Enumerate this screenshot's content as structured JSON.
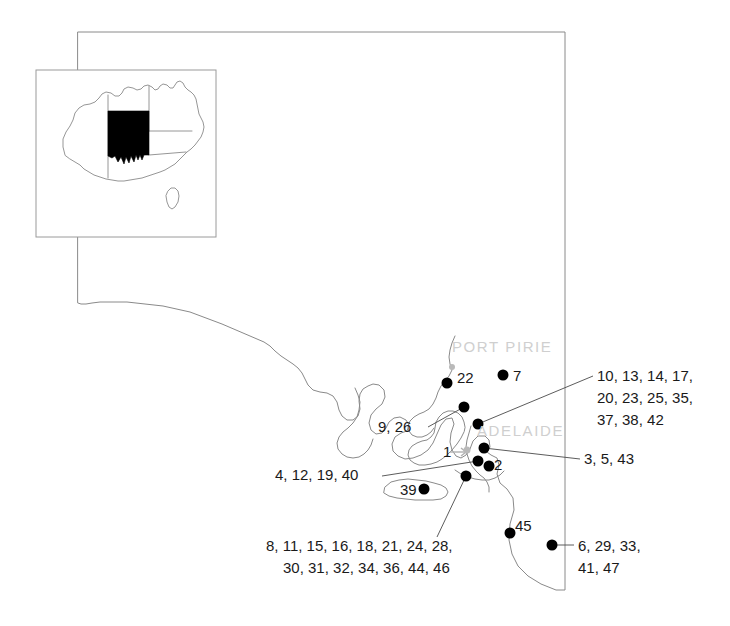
{
  "figure": {
    "name": "south-australia-site-map",
    "region": "South Australia",
    "background_color": "#ffffff",
    "outline_color": "#8a8a8a",
    "dot_color": "#000000",
    "city_label_color": "#cfcfcf",
    "label_color": "#1a1a1a"
  },
  "inset": {
    "name": "australia-locator-inset",
    "highlight_color": "#000000",
    "frame_color": "#9a9a9a"
  },
  "city_labels": [
    {
      "text": "PORT PIRIE",
      "x": 452,
      "y": 352
    },
    {
      "text": "ADELAIDE",
      "x": 477,
      "y": 436
    }
  ],
  "site_dots": [
    {
      "id": "dot-22",
      "x": 447,
      "y": 383
    },
    {
      "id": "dot-7",
      "x": 503,
      "y": 375
    },
    {
      "id": "dot-9-26",
      "x": 464,
      "y": 407
    },
    {
      "id": "dot-10-group",
      "x": 478,
      "y": 424
    },
    {
      "id": "dot-3-5-43",
      "x": 484,
      "y": 448
    },
    {
      "id": "dot-4-12-19-40",
      "x": 478,
      "y": 461
    },
    {
      "id": "dot-2",
      "x": 489,
      "y": 466
    },
    {
      "id": "dot-8-group",
      "x": 466,
      "y": 476
    },
    {
      "id": "dot-39",
      "x": 424,
      "y": 489
    },
    {
      "id": "dot-45",
      "x": 510,
      "y": 533
    },
    {
      "id": "dot-6-29-33-41-47",
      "x": 552,
      "y": 545
    }
  ],
  "city_dots": [
    {
      "id": "port-pirie-dot",
      "x": 452,
      "y": 367
    },
    {
      "id": "adelaide-dot",
      "x": 467,
      "y": 450
    }
  ],
  "point_labels": [
    {
      "name": "label-22",
      "text": "22",
      "x": 457,
      "y": 383
    },
    {
      "name": "label-7",
      "text": "7",
      "x": 513,
      "y": 381
    },
    {
      "name": "label-1",
      "text": "1",
      "x": 443,
      "y": 457
    },
    {
      "name": "label-2",
      "text": "2",
      "x": 494,
      "y": 470
    },
    {
      "name": "label-39",
      "text": "39",
      "x": 400,
      "y": 495
    },
    {
      "name": "label-45",
      "text": "45",
      "x": 515,
      "y": 531
    }
  ],
  "group_labels": [
    {
      "name": "label-group-9-26",
      "lines": [
        "9, 26"
      ],
      "x": 378,
      "y": 432,
      "anchor": "start"
    },
    {
      "name": "label-group-northeast",
      "lines": [
        "10, 13, 14, 17,",
        "20, 23, 25, 35,",
        "37, 38, 42"
      ],
      "x": 597,
      "y": 381,
      "anchor": "start"
    },
    {
      "name": "label-group-3-5-43",
      "lines": [
        "3, 5, 43"
      ],
      "x": 584,
      "y": 464,
      "anchor": "start"
    },
    {
      "name": "label-group-4-12-19-40",
      "lines": [
        "4, 12, 19, 40"
      ],
      "x": 275,
      "y": 480,
      "anchor": "start"
    },
    {
      "name": "label-group-southwest",
      "lines": [
        "8, 11, 15, 16, 18, 21, 24, 28,",
        "30, 31, 32, 34, 36, 44, 46"
      ],
      "x": 266,
      "y": 551,
      "anchor": "start"
    },
    {
      "name": "label-group-southeast",
      "lines": [
        "6, 29, 33,",
        "41, 47"
      ],
      "x": 578,
      "y": 551,
      "anchor": "start"
    }
  ],
  "leader_lines": [
    {
      "name": "leader-9-26",
      "points": "428,427 464,407"
    },
    {
      "name": "leader-northeast",
      "points": "478,424 593,376"
    },
    {
      "name": "leader-3-5-43",
      "points": "484,448 580,459"
    },
    {
      "name": "leader-4-12-19-40",
      "points": "382,476 478,461"
    },
    {
      "name": "leader-southwest",
      "points": "466,476 437,537"
    },
    {
      "name": "leader-southeast",
      "points": "552,545 574,545"
    }
  ]
}
